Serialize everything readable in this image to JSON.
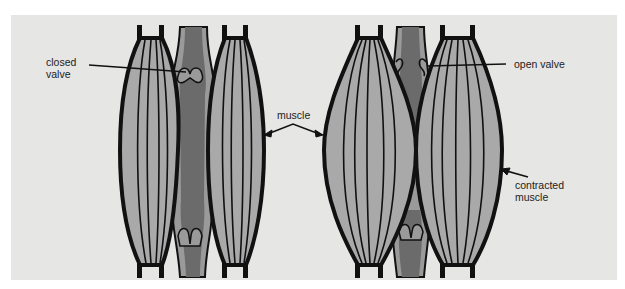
{
  "figure": {
    "colors": {
      "background": "#e6e6e4",
      "outline": "#111111",
      "muscle_fill": "#a9a9a9",
      "vein_wall": "#9a9a9a",
      "vein_blood": "#6b6b6b"
    },
    "labels": {
      "closed_valve": "closed\nvalve",
      "muscle": "muscle",
      "open_valve": "open valve",
      "contracted_muscle": "contracted\nmuscle"
    },
    "panels": [
      {
        "state": "relaxed",
        "valves": [
          "closed (top)",
          "closed (bottom)"
        ]
      },
      {
        "state": "contracted",
        "valves": [
          "open (top)",
          "closed (bottom)"
        ]
      }
    ]
  }
}
